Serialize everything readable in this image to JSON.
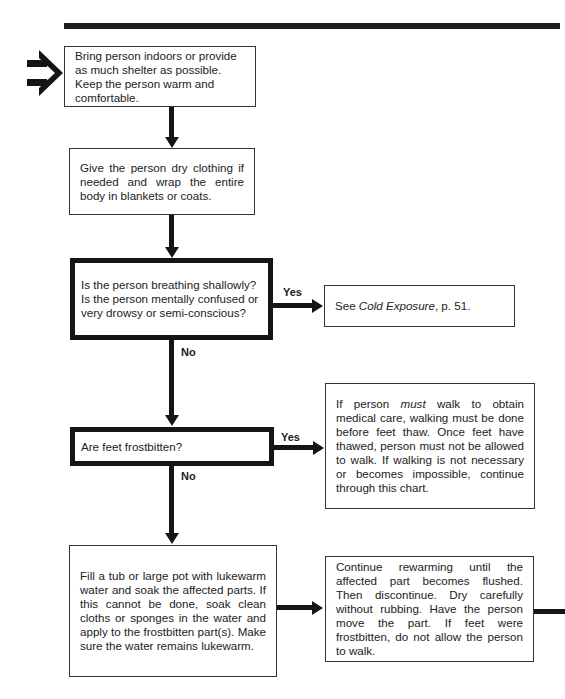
{
  "flowchart": {
    "entry_icon": "right-pointing-double-arrow-icon",
    "steps": [
      {
        "id": "shelter",
        "text": "Bring person indoors or provide as much shelter as possible. Keep the person warm and comfortable."
      },
      {
        "id": "dry-clothing",
        "text": "Give the person dry clothing if needed and wrap the entire body in blankets or coats."
      },
      {
        "id": "breathing-question",
        "text": "Is the person breathing shallowly? Is the person mentally confused or very drowsy or semi-conscious?",
        "type": "decision"
      },
      {
        "id": "see-cold-exposure",
        "text_prefix": "See ",
        "text_italic": "Cold Exposure",
        "text_suffix": ", p. 51."
      },
      {
        "id": "feet-question",
        "text": "Are feet frostbitten?",
        "type": "decision"
      },
      {
        "id": "must-walk",
        "text_prefix": "If person ",
        "text_italic": "must",
        "text_suffix": " walk to obtain medical care, walking must be done before feet thaw. Once feet have thawed, person must not be allowed to walk. If walking is not necessary or becomes impossible, continue through this chart."
      },
      {
        "id": "soak",
        "text": "Fill a tub or large pot with lukewarm water and soak the affected parts. If this cannot be done, soak clean cloths or sponges in the water and apply to the frostbitten part(s). Make sure the water remains lukewarm."
      },
      {
        "id": "rewarm",
        "text": "Continue rewarming until the affected part becomes flushed. Then discontinue. Dry carefully without rubbing. Have the person move the part. If feet were frostbitten, do not allow the person to walk."
      }
    ],
    "labels": {
      "yes1": "Yes",
      "no1": "No",
      "yes2": "Yes",
      "no2": "No"
    }
  }
}
